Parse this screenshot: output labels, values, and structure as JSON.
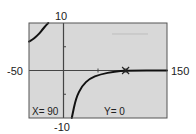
{
  "chart_data": {
    "type": "line",
    "title": "",
    "xlabel": "",
    "ylabel": "",
    "xlim": [
      -50,
      150
    ],
    "ylim": [
      -10,
      10
    ],
    "x_min_label": "-50",
    "x_max_label": "150",
    "y_min_label": "-10",
    "y_max_label": "10",
    "x_ticks": [
      50
    ],
    "y_ticks": [
      -5,
      5
    ],
    "grid": false,
    "series": [
      {
        "name": "left-branch",
        "points": [
          [
            -50,
            6.1
          ],
          [
            -45,
            6.5
          ],
          [
            -40,
            7.1
          ],
          [
            -35,
            7.8
          ],
          [
            -30,
            8.7
          ],
          [
            -26,
            9.4
          ],
          [
            -22,
            10
          ]
        ]
      },
      {
        "name": "right-branch",
        "points": [
          [
            12,
            -10
          ],
          [
            18,
            -5.8
          ],
          [
            27,
            -3.2
          ],
          [
            38,
            -1.7
          ],
          [
            53,
            -0.8
          ],
          [
            75,
            -0.2
          ],
          [
            90,
            0
          ],
          [
            150,
            0
          ]
        ]
      }
    ],
    "cursor": {
      "x": 90,
      "y": 0
    },
    "readout": {
      "x_text": "X= 90",
      "y_text": "Y= 0"
    },
    "colors": {
      "plot_bg": "#d8d8d8",
      "curve": "#111111",
      "axis": "#444444",
      "frame": "#555555"
    }
  }
}
